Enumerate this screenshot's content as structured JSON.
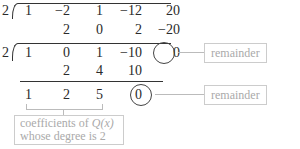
{
  "division_1": {
    "divisor": "2",
    "dividend": [
      "1",
      "−2",
      "1",
      "−12",
      "20"
    ],
    "products": [
      "2",
      "0",
      "2",
      "−20"
    ]
  },
  "division_2": {
    "divisor": "2",
    "dividend": [
      "1",
      "0",
      "1",
      "−10",
      "0"
    ],
    "products": [
      "2",
      "4",
      "10"
    ]
  },
  "result": [
    "1",
    "2",
    "5",
    "0"
  ],
  "annotations": {
    "remainder_1": "remainder",
    "remainder_2": "remainder",
    "coefficients_line1_prefix": "coefficients of ",
    "coefficients_q": "Q(x)",
    "coefficients_line2": "whose degree is 2"
  }
}
